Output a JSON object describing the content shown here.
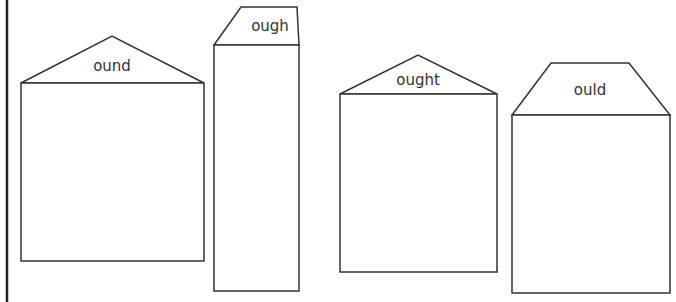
{
  "worksheet": {
    "colors": {
      "stroke": "#333333",
      "margin_bar": "#222222",
      "background": "#ffffff"
    },
    "houses": [
      {
        "label": "ound",
        "roof_shape": "triangle"
      },
      {
        "label": "ough",
        "roof_shape": "trapezoid"
      },
      {
        "label": "ought",
        "roof_shape": "triangle"
      },
      {
        "label": "ould",
        "roof_shape": "trapezoid"
      }
    ]
  }
}
